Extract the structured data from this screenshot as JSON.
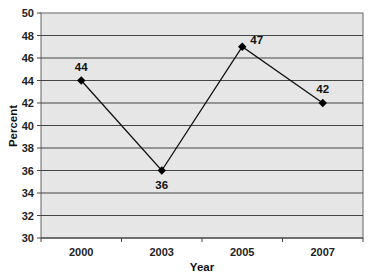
{
  "chart_data": {
    "type": "line",
    "title": "",
    "xlabel": "Year",
    "ylabel": "Percent",
    "categories": [
      "2000",
      "2003",
      "2005",
      "2007"
    ],
    "series": [
      {
        "name": "Percent",
        "values": [
          44,
          36,
          47,
          42
        ],
        "data_labels": [
          "44",
          "36",
          "47",
          "42"
        ]
      }
    ],
    "ylim": [
      30,
      50
    ],
    "yticks": [
      30,
      32,
      34,
      36,
      38,
      40,
      42,
      44,
      46,
      48,
      50
    ],
    "grid": true,
    "legend": "none",
    "colors": {
      "plot_bg": "#e6e6e6",
      "line": "#111111",
      "grid": "#444444"
    }
  }
}
